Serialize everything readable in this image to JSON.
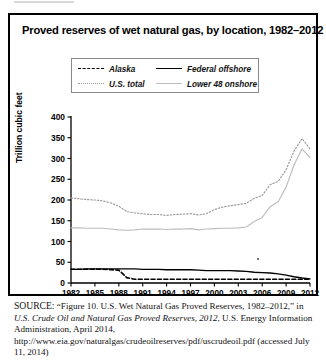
{
  "figure": {
    "title": "Proved reserves of wet natural gas, by location, 1982–2012",
    "y_axis_title": "Trillion cubic feet"
  },
  "legend": {
    "items": [
      {
        "label": "Alaska",
        "style": "dashed",
        "color": "#000000"
      },
      {
        "label": "Federal offshore",
        "style": "solid",
        "color": "#000000"
      },
      {
        "label": "U.S. total",
        "style": "dotted",
        "color": "#9a9a9a"
      },
      {
        "label": "Lower 48 onshore",
        "style": "solid",
        "color": "#bdbdbd"
      }
    ]
  },
  "source": {
    "prefix": "SOURCE:",
    "text_1": "“Figure 10. U.S. Wet Natural Gas Proved Reserves, 1982–2012,” in ",
    "italic_1": "U.S. Crude Oil and Natural Gas Proved Reserves, 2012",
    "text_2": ", U.S. Energy Information Administration, April 2014, http://www.eia.gov/naturalgas/crudeoilreserves/pdf/uscrudeoil.pdf (accessed July 11, 2014)"
  },
  "chart_data": {
    "type": "line",
    "title": "Proved reserves of wet natural gas, by location, 1982–2012",
    "xlabel": "",
    "ylabel": "Trillion cubic feet",
    "xlim": [
      1982,
      2012
    ],
    "ylim": [
      0,
      400
    ],
    "ytick_values": [
      0,
      50,
      100,
      150,
      200,
      250,
      300,
      350,
      400
    ],
    "xtick_values": [
      1982,
      1985,
      1988,
      1991,
      1994,
      1997,
      2000,
      2003,
      2006,
      2009,
      2012
    ],
    "grid": false,
    "legend_position": "top-center",
    "x": [
      1982,
      1983,
      1984,
      1985,
      1986,
      1987,
      1988,
      1989,
      1990,
      1991,
      1992,
      1993,
      1994,
      1995,
      1996,
      1997,
      1998,
      1999,
      2000,
      2001,
      2002,
      2003,
      2004,
      2005,
      2006,
      2007,
      2008,
      2009,
      2010,
      2011,
      2012
    ],
    "series": [
      {
        "name": "U.S. total",
        "style": "dotted",
        "color": "#9a9a9a",
        "values": [
          205,
          203,
          201,
          200,
          198,
          193,
          185,
          172,
          169,
          167,
          165,
          165,
          163,
          165,
          166,
          167,
          164,
          167,
          177,
          183,
          186,
          189,
          192,
          204,
          211,
          237,
          245,
          273,
          318,
          348,
          323
        ]
      },
      {
        "name": "Lower 48 onshore",
        "style": "solid",
        "color": "#bdbdbd",
        "values": [
          133,
          133,
          132,
          132,
          132,
          130,
          128,
          127,
          128,
          130,
          130,
          130,
          129,
          130,
          130,
          131,
          128,
          130,
          131,
          132,
          132,
          133,
          135,
          148,
          158,
          184,
          196,
          231,
          285,
          323,
          302
        ]
      },
      {
        "name": "Federal offshore",
        "style": "solid",
        "color": "#000000",
        "values": [
          33,
          33,
          34,
          34,
          34,
          34,
          34,
          34,
          34,
          33,
          33,
          33,
          32,
          32,
          32,
          32,
          31,
          30,
          30,
          30,
          30,
          29,
          28,
          26,
          25,
          24,
          22,
          19,
          15,
          12,
          10
        ]
      },
      {
        "name": "Alaska",
        "style": "dashed",
        "color": "#000000",
        "values": [
          33,
          33,
          33,
          33,
          33,
          32,
          31,
          13,
          9,
          9,
          9,
          9,
          9,
          9,
          9,
          9,
          9,
          9,
          9,
          9,
          9,
          9,
          9,
          9,
          9,
          9,
          9,
          9,
          9,
          9,
          9
        ]
      }
    ]
  }
}
